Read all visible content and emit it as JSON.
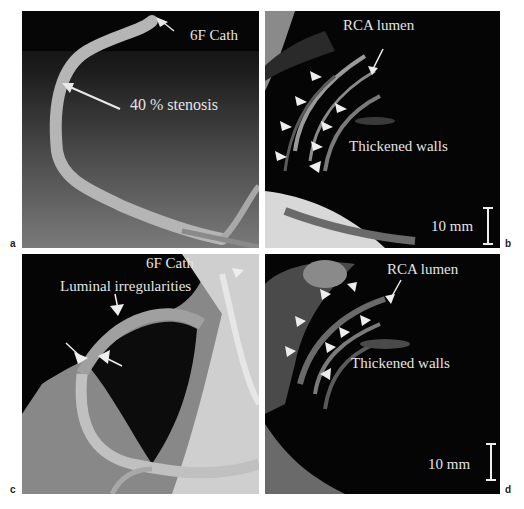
{
  "figure": {
    "panels": [
      {
        "label": "a",
        "annotations": {
          "catheter": "6F Cath",
          "stenosis": "40 % stenosis"
        }
      },
      {
        "label": "b",
        "annotations": {
          "lumen": "RCA lumen",
          "walls": "Thickened walls",
          "scale": "10 mm"
        }
      },
      {
        "label": "c",
        "annotations": {
          "catheter": "6F Cath",
          "irregularities": "Luminal irregularities"
        }
      },
      {
        "label": "d",
        "annotations": {
          "lumen": "RCA lumen",
          "walls": "Thickened walls",
          "scale": "10 mm"
        }
      }
    ]
  }
}
